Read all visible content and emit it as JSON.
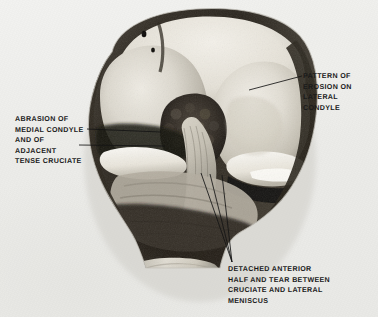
{
  "figure": {
    "kind": "gross-pathology-photograph",
    "background_color": "#ecece9",
    "ink_color": "#141414"
  },
  "annotations": [
    {
      "id": "pattern-of-erosion",
      "align": "left",
      "x": 303,
      "y": 71,
      "lines": [
        "PATTERN OF",
        "EROSION ON",
        "LATERAL",
        "CONDYLE"
      ],
      "leaders": [
        {
          "x1": 302,
          "y1": 76,
          "x2": 249,
          "y2": 90
        }
      ]
    },
    {
      "id": "abrasion-of-medial-condyle",
      "align": "left",
      "x": 15,
      "y": 114,
      "lines": [
        "ABRASION OF",
        "MEDIAL CONDYLE",
        "AND OF",
        "ADJACENT",
        "TENSE CRUCIATE"
      ],
      "leaders": [
        {
          "x1": 87,
          "y1": 129,
          "x2": 161,
          "y2": 132
        },
        {
          "x1": 79,
          "y1": 145,
          "x2": 165,
          "y2": 146
        }
      ]
    },
    {
      "id": "detached-anterior-half",
      "align": "left",
      "x": 228,
      "y": 264,
      "lines": [
        "DETACHED ANTERIOR",
        "HALF AND TEAR BETWEEN",
        "CRUCIATE AND LATERAL",
        "MENISCUS"
      ],
      "leaders": [
        {
          "x1": 232,
          "y1": 262,
          "x2": 201,
          "y2": 173
        },
        {
          "x1": 232,
          "y1": 262,
          "x2": 210,
          "y2": 174
        },
        {
          "x1": 232,
          "y1": 262,
          "x2": 222,
          "y2": 175
        }
      ]
    }
  ]
}
